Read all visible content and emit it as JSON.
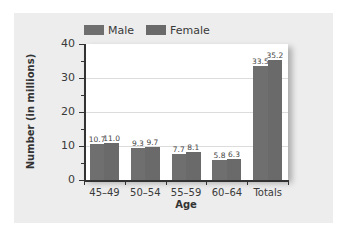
{
  "chart_data": {
    "type": "bar",
    "title": "",
    "xlabel": "Age",
    "ylabel": "Number (in millions)",
    "categories": [
      "45–49",
      "50–54",
      "55–59",
      "60–64",
      "Totals"
    ],
    "series": [
      {
        "name": "Male",
        "values": [
          10.7,
          9.3,
          7.7,
          5.8,
          33.5
        ],
        "labels": [
          "10.7",
          "9.3",
          "7.7",
          "5.8",
          "33.5"
        ],
        "color": "#6f6f6f"
      },
      {
        "name": "Female",
        "values": [
          11.0,
          9.7,
          8.1,
          6.3,
          35.2
        ],
        "labels": [
          "11.0",
          "9.7",
          "8.1",
          "6.3",
          "35.2"
        ],
        "color": "#6a6a6a"
      }
    ],
    "ylim": [
      0,
      40
    ],
    "yticks": [
      "0",
      "10",
      "20",
      "30",
      "40"
    ],
    "grid": true,
    "legend_position": "top-left"
  },
  "colors": {
    "panel_background": "#ededed",
    "plot_background": "#ffffff",
    "male": "#6f6f6f",
    "female": "#6a6a6a",
    "gridline": "#dcdcdc",
    "axis": "#333333"
  }
}
